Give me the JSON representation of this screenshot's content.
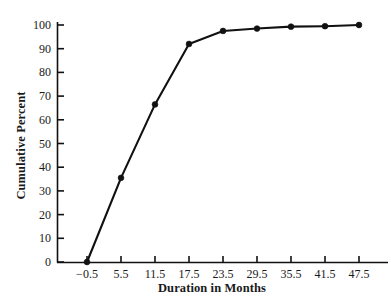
{
  "chart_data": {
    "type": "line",
    "title": "",
    "xlabel": "Duration in Months",
    "ylabel": "Cumulative Percent",
    "x": [
      -0.5,
      5.5,
      11.5,
      17.5,
      23.5,
      29.5,
      35.5,
      41.5,
      47.5
    ],
    "values": [
      0,
      35.5,
      66.5,
      92,
      97.5,
      98.5,
      99.3,
      99.5,
      100
    ],
    "xtick_labels": [
      "−0.5",
      "5.5",
      "11.5",
      "17.5",
      "23.5",
      "29.5",
      "35.5",
      "41.5",
      "47.5"
    ],
    "ytick_labels": [
      "0",
      "10",
      "20",
      "30",
      "40",
      "50",
      "60",
      "70",
      "80",
      "90",
      "100"
    ],
    "ytick_values": [
      0,
      10,
      20,
      30,
      40,
      50,
      60,
      70,
      80,
      90,
      100
    ],
    "xlim": [
      -3.5,
      50.5
    ],
    "ylim": [
      0,
      100
    ],
    "grid": false,
    "legend": false,
    "marker": "filled-circle",
    "line_color": "#111111",
    "marker_color": "#111111",
    "background_color": "#ffffff"
  },
  "annotations": {
    "top_edge_artifact": "............"
  }
}
